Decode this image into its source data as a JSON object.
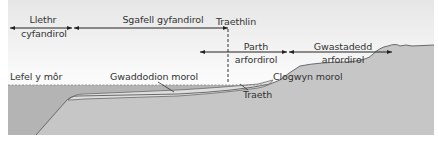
{
  "diagram": {
    "type": "coastal-profile-cross-section",
    "colors": {
      "sky_top": "#e8e8e8",
      "sky_bottom": "#ffffff",
      "sea": "#b4b4b4",
      "land": "#c6c6c6",
      "sediment": "#dcdcdc",
      "outline": "#6a6a6a",
      "arrow": "#222222",
      "text": "#333333"
    },
    "zones": {
      "continental_slope": {
        "line1": "Llethr",
        "line2": "cyfandirol"
      },
      "continental_shelf": {
        "label": "Sgafell gyfandirol"
      },
      "shoreline": {
        "label": "Traethlin"
      },
      "coastal_zone": {
        "line1": "Parth",
        "line2": "arfordirol"
      },
      "coastal_plain": {
        "line1": "Gwastadedd",
        "line2": "arfordirol"
      }
    },
    "features": {
      "sea_level": "Lefel y môr",
      "marine_sediments": "Gwaddodion morol",
      "sea_cliff": "Clogwyn morol",
      "beach": "Traeth"
    }
  }
}
